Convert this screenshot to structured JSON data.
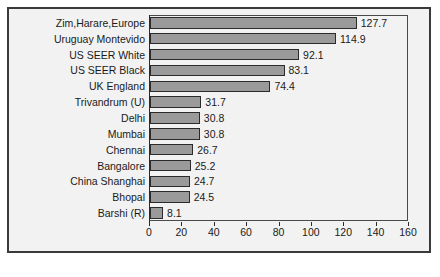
{
  "chart_data": {
    "type": "bar",
    "orientation": "horizontal",
    "title": "",
    "xlabel": "",
    "ylabel": "",
    "xlim": [
      0,
      160
    ],
    "xticks": [
      0,
      20,
      40,
      60,
      80,
      100,
      120,
      140,
      160
    ],
    "grid": false,
    "legend": null,
    "bar_color": "#9a9a9a",
    "bar_edge_color": "#2b2b2b",
    "plot_background": "#f2f2f2",
    "categories": [
      "Zim,Harare,Europe",
      "Uruguay Montevido",
      "US SEER White",
      "US SEER Black",
      "UK England",
      "Trivandrum (U)",
      "Delhi",
      "Mumbai",
      "Chennai",
      "Bangalore",
      "China Shanghai",
      "Bhopal",
      "Barshi (R)"
    ],
    "values": [
      127.7,
      114.9,
      92.1,
      83.1,
      74.4,
      31.7,
      30.8,
      30.8,
      26.7,
      25.2,
      24.7,
      24.5,
      8.1
    ],
    "value_labels": [
      "127.7",
      "114.9",
      "92.1",
      "83.1",
      "74.4",
      "31.7",
      "30.8",
      "30.8",
      "26.7",
      "25.2",
      "24.7",
      "24.5",
      "8.1"
    ],
    "tick_labels": [
      "0",
      "20",
      "40",
      "60",
      "80",
      "100",
      "120",
      "140",
      "160"
    ]
  },
  "caption": {
    "text": ""
  }
}
